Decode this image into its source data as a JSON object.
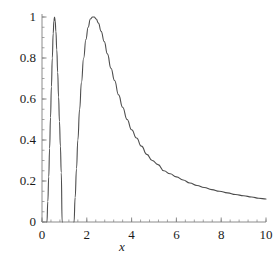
{
  "chart_data": {
    "type": "line",
    "title": "",
    "subtitle": "",
    "xlabel": "x",
    "ylabel": "",
    "xlim": [
      0,
      10
    ],
    "ylim": [
      0,
      1
    ],
    "grid": false,
    "legend": null,
    "legend_position": "none",
    "x_ticks": [
      0,
      2,
      4,
      6,
      8,
      10
    ],
    "x_tick_labels": [
      "0",
      "2",
      "4",
      "6",
      "8",
      "10"
    ],
    "x_minor_tick_step": 0.4,
    "y_ticks": [
      0,
      0.2,
      0.4,
      0.6,
      0.8,
      1
    ],
    "y_tick_labels": [
      "0",
      "0.2",
      "0.4",
      "0.6",
      "0.8",
      "1"
    ],
    "y_minor_tick_step": 0.05,
    "line_color": "#4d4d4d",
    "axis_color": "#808080",
    "background_color": "#ffffff",
    "annotations": [
      {
        "label": "narrow spike peak",
        "x": 0.56,
        "y": 1.0
      },
      {
        "label": "broad peak",
        "x": 2.33,
        "y": 1.0
      }
    ],
    "series": [
      {
        "name": "curve",
        "x": [
          0.22,
          0.26,
          0.3,
          0.34,
          0.38,
          0.42,
          0.46,
          0.5,
          0.53,
          0.56,
          0.59,
          0.62,
          0.66,
          0.7,
          0.74,
          0.78,
          0.82,
          0.86,
          0.9,
          1.43,
          1.48,
          1.54,
          1.6,
          1.68,
          1.76,
          1.86,
          1.96,
          2.06,
          2.16,
          2.26,
          2.33,
          2.42,
          2.52,
          2.64,
          2.78,
          2.92,
          3.08,
          3.24,
          3.42,
          3.6,
          3.8,
          4.0,
          4.22,
          4.44,
          4.68,
          4.92,
          5.18,
          5.44,
          5.72,
          6.0,
          6.3,
          6.6,
          6.92,
          7.24,
          7.58,
          7.92,
          8.28,
          8.64,
          9.0,
          9.36,
          9.68,
          10.0
        ],
        "y": [
          0.0,
          0.1,
          0.22,
          0.36,
          0.51,
          0.66,
          0.8,
          0.92,
          0.98,
          1.0,
          0.98,
          0.93,
          0.84,
          0.73,
          0.61,
          0.49,
          0.37,
          0.24,
          0.0,
          0.0,
          0.12,
          0.26,
          0.4,
          0.55,
          0.68,
          0.8,
          0.89,
          0.95,
          0.99,
          1.0,
          1.0,
          0.99,
          0.97,
          0.93,
          0.88,
          0.82,
          0.75,
          0.69,
          0.62,
          0.56,
          0.5,
          0.45,
          0.41,
          0.37,
          0.33,
          0.3,
          0.28,
          0.25,
          0.235,
          0.22,
          0.205,
          0.19,
          0.178,
          0.168,
          0.158,
          0.15,
          0.142,
          0.134,
          0.128,
          0.122,
          0.116,
          0.112
        ]
      }
    ]
  },
  "axes": {
    "x_label_text": "x"
  }
}
